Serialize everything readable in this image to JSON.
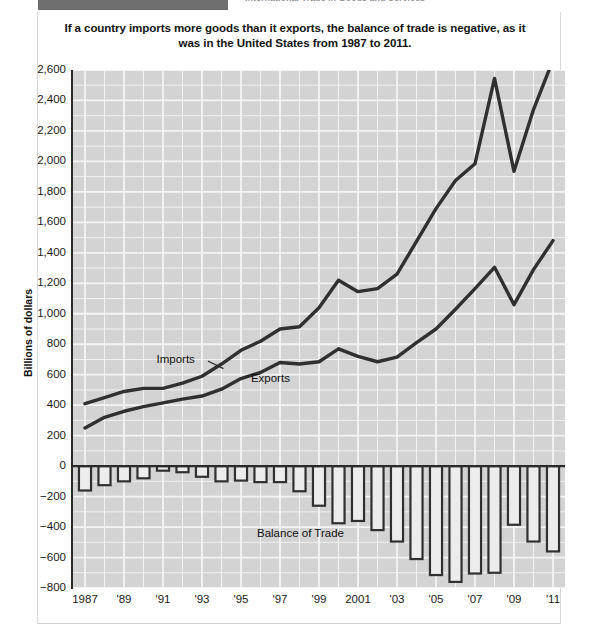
{
  "header": {
    "tab_label": "",
    "title": "International Trade in Goods and Services"
  },
  "caption": {
    "line1": "If a country imports more goods than it exports, the balance of trade is negative, as",
    "line2": "it was in the United States from 1987 to 2011."
  },
  "chart_data": {
    "type": "line",
    "title": "If a country imports more goods than it exports, the balance of trade is negative, as it was in the United States from 1987 to 2011.",
    "xlabel": "",
    "ylabel": "Billions of dollars",
    "ylim": [
      -800,
      2600
    ],
    "ytick_labels": [
      "2,600",
      "2,400",
      "2,200",
      "2,000",
      "1,800",
      "1,600",
      "1,400",
      "1,200",
      "1,000",
      "800",
      "600",
      "400",
      "200",
      "0",
      "−200",
      "−400",
      "−600",
      "−800"
    ],
    "ytick_values": [
      2600,
      2400,
      2200,
      2000,
      1800,
      1600,
      1400,
      1200,
      1000,
      800,
      600,
      400,
      200,
      0,
      -200,
      -400,
      -600,
      -800
    ],
    "grid": true,
    "legend_position": "inline-annotation",
    "x": [
      1987,
      1988,
      1989,
      1990,
      1991,
      1992,
      1993,
      1994,
      1995,
      1996,
      1997,
      1998,
      1999,
      2000,
      2001,
      2002,
      2003,
      2004,
      2005,
      2006,
      2007,
      2008,
      2009,
      2010,
      2011
    ],
    "xtick_labels": [
      "1987",
      "'89",
      "'91",
      "'93",
      "'95",
      "'97",
      "'99",
      "2001",
      "'03",
      "'05",
      "'07",
      "'09",
      "'11"
    ],
    "xtick_years": [
      1987,
      1989,
      1991,
      1993,
      1995,
      1997,
      1999,
      2001,
      2003,
      2005,
      2007,
      2009,
      2011
    ],
    "series": [
      {
        "name": "Imports",
        "label_x": 1992.0,
        "label_y": 690,
        "values": [
          410,
          450,
          490,
          510,
          510,
          545,
          590,
          670,
          760,
          820,
          900,
          915,
          1040,
          1220,
          1145,
          1165,
          1260,
          1475,
          1690,
          1875,
          1985,
          2545,
          1935,
          2340,
          2665
        ]
      },
      {
        "name": "Exports",
        "label_x": 1995.2,
        "label_y": 565,
        "values": [
          250,
          320,
          360,
          390,
          415,
          440,
          460,
          505,
          575,
          615,
          680,
          670,
          685,
          770,
          720,
          685,
          715,
          810,
          900,
          1030,
          1165,
          1305,
          1060,
          1290,
          1480
        ]
      }
    ],
    "bars": {
      "name": "Balance of Trade",
      "label_x": 1999.0,
      "label_y": -455,
      "values": [
        -160,
        -125,
        -100,
        -80,
        -30,
        -40,
        -70,
        -100,
        -95,
        -105,
        -105,
        -165,
        -260,
        -375,
        -360,
        -420,
        -495,
        -610,
        -715,
        -760,
        -705,
        -700,
        -385,
        -495,
        -560
      ]
    },
    "colors": {
      "plot_background": "#d3d3d3",
      "gridline": "#f2f2f2",
      "line": "#303030",
      "bar_fill": "#e8e8e8",
      "bar_outline": "#303030",
      "axis": "#2a2a2a",
      "text": "#141414"
    }
  }
}
